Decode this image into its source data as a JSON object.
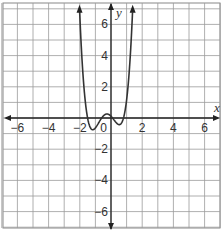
{
  "chart_data": {
    "type": "line",
    "title": "",
    "xlabel": "x",
    "ylabel": "y",
    "xlim": [
      -7,
      7
    ],
    "ylim": [
      -7,
      7
    ],
    "grid": true,
    "x_ticks": [
      -6,
      -4,
      -2,
      0,
      2,
      4,
      6
    ],
    "y_ticks": [
      6,
      4,
      2,
      -2,
      -4,
      -6
    ],
    "x_tick_labels": [
      "−6",
      "−4",
      "−2",
      "0",
      "2",
      "4",
      "6"
    ],
    "y_tick_labels": [
      "6",
      "4",
      "2",
      "−2",
      "−4",
      "−6"
    ],
    "series": [
      {
        "name": "quartic",
        "description": "even-degree polynomial, both ends rising, two local minima slightly below 0 and a local maximum slightly above 0",
        "approx_roots": [
          -1.5,
          -0.6,
          0.1,
          0.8
        ],
        "points": [
          {
            "x": -2.3,
            "y": 7
          },
          {
            "x": -2,
            "y": 3.6
          },
          {
            "x": -1.5,
            "y": 0
          },
          {
            "x": -1.1,
            "y": -0.35
          },
          {
            "x": -0.6,
            "y": 0
          },
          {
            "x": -0.25,
            "y": 0.3
          },
          {
            "x": 0.1,
            "y": 0
          },
          {
            "x": 0.45,
            "y": -0.3
          },
          {
            "x": 0.8,
            "y": 0
          },
          {
            "x": 1.2,
            "y": 2.3
          },
          {
            "x": 1.45,
            "y": 7
          }
        ]
      }
    ]
  }
}
